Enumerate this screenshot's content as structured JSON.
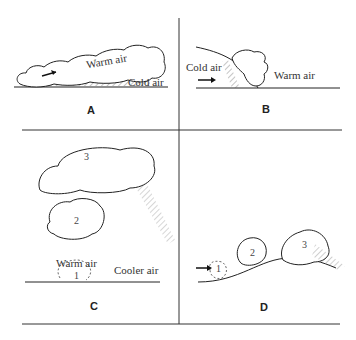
{
  "figure": {
    "panels": [
      {
        "id": "A",
        "letter": "A",
        "labels": {
          "warm": "Warm air",
          "cold": "Cold air"
        }
      },
      {
        "id": "B",
        "letter": "B",
        "labels": {
          "cold": "Cold air",
          "warm": "Warm air"
        }
      },
      {
        "id": "C",
        "letter": "C",
        "labels": {
          "warm": "Warm air",
          "cool": "Cooler air"
        },
        "stages": [
          "1",
          "2",
          "3"
        ]
      },
      {
        "id": "D",
        "letter": "D",
        "stages": [
          "1",
          "2",
          "3"
        ]
      }
    ]
  }
}
